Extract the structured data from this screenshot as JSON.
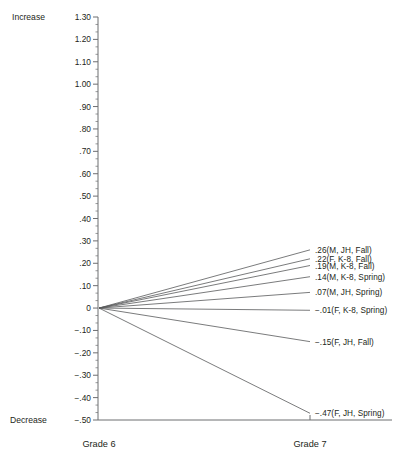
{
  "chart_data": {
    "type": "line",
    "title": "",
    "xlabel": "",
    "ylabel": "",
    "x": [
      "Grade 6",
      "Grade 7"
    ],
    "categories": [
      "Grade 6",
      "Grade 7"
    ],
    "ylim": [
      -0.5,
      1.3
    ],
    "ytick_step": 0.1,
    "minor_ticks_per_interval": 2,
    "grid": false,
    "legend": "none",
    "y_axis_top_annotation": "Increase",
    "y_axis_bottom_annotation": "Decrease",
    "ytick_labels": [
      "1.30",
      "1.20",
      "1.10",
      "1.00",
      ".90",
      ".80",
      ".70",
      ".60",
      ".50",
      ".40",
      ".30",
      ".20",
      ".10",
      "0",
      "−.10",
      "−.20",
      "−.30",
      "−.40",
      "−.50"
    ],
    "ytick_values": [
      1.3,
      1.2,
      1.1,
      1.0,
      0.9,
      0.8,
      0.7,
      0.6,
      0.5,
      0.4,
      0.3,
      0.2,
      0.1,
      0.0,
      -0.1,
      -0.2,
      -0.3,
      -0.4,
      -0.5
    ],
    "series": [
      {
        "name": "M, JH, Fall",
        "label": ".26(M, JH, Fall)",
        "values": [
          0,
          0.26
        ]
      },
      {
        "name": "F, K-8, Fall",
        "label": ".22(F, K-8, Fall)",
        "values": [
          0,
          0.22
        ]
      },
      {
        "name": "M, K-8, Fall",
        "label": ".19(M, K-8, Fall)",
        "values": [
          0,
          0.19
        ]
      },
      {
        "name": "M, K-8, Spring",
        "label": ".14(M, K-8, Spring)",
        "values": [
          0,
          0.14
        ]
      },
      {
        "name": "M, JH, Spring",
        "label": ".07(M, JH, Spring)",
        "values": [
          0,
          0.07
        ]
      },
      {
        "name": "F, K-8, Spring",
        "label": "−.01(F, K-8, Spring)",
        "values": [
          0,
          -0.01
        ]
      },
      {
        "name": "F, JH, Fall",
        "label": "−.15(F, JH, Fall)",
        "values": [
          0,
          -0.15
        ]
      },
      {
        "name": "F, JH, Spring",
        "label": "−.47(F, JH, Spring)",
        "values": [
          0,
          -0.47
        ]
      }
    ],
    "colors": {
      "line": "#58595b",
      "axis": "#6d6e71",
      "text": "#231f20",
      "background": "#ffffff"
    }
  },
  "axis_labels": {
    "increase": "Increase",
    "decrease": "Decrease",
    "grade6": "Grade 6",
    "grade7": "Grade 7"
  }
}
